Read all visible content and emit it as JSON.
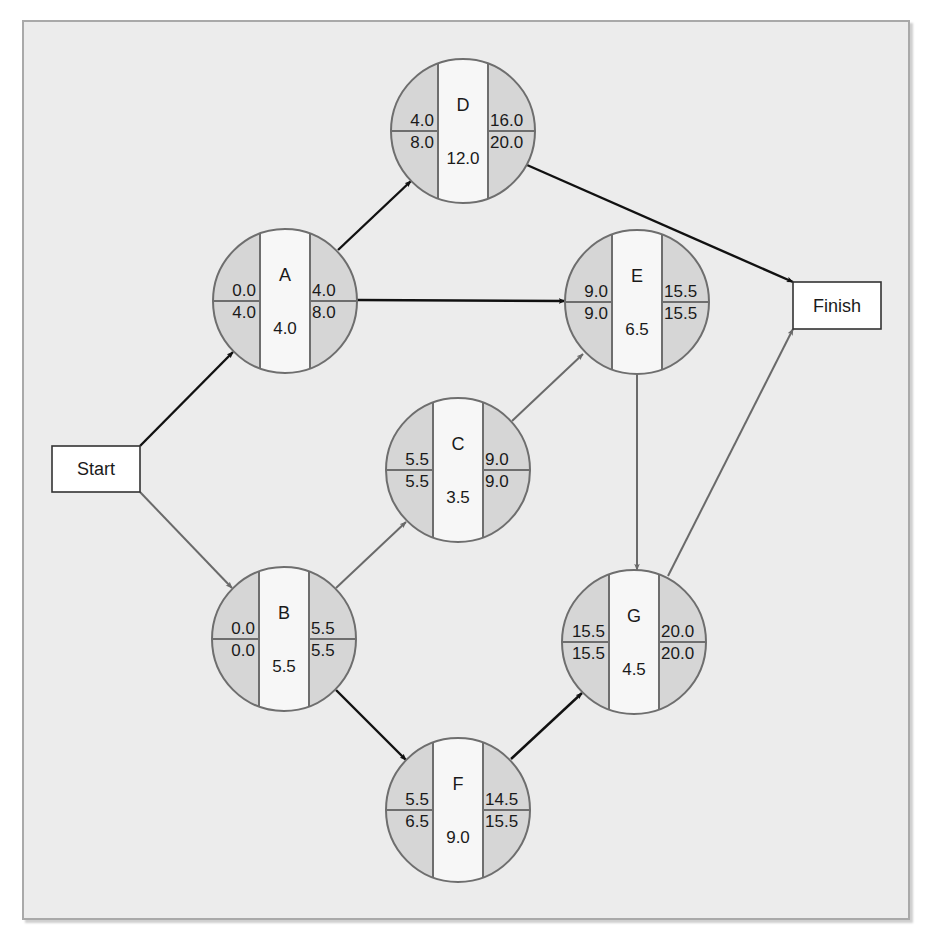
{
  "diagram": {
    "type": "activity-on-node network (project schedule / critical path)",
    "colors": {
      "panel_bg": "#ececec",
      "panel_border": "#a9a9a9",
      "node_side_fill": "#d6d6d6",
      "node_center_fill": "#f7f7f7",
      "node_outline": "#6e6e6e",
      "critical_arrow": "#111111",
      "noncritical_arrow": "#6a6a6a",
      "terminal_fill": "#ffffff",
      "terminal_border": "#333333"
    },
    "terminals": [
      {
        "id": "start",
        "label": "Start",
        "x": 52,
        "y": 446,
        "w": 88,
        "h": 46
      },
      {
        "id": "finish",
        "label": "Finish",
        "x": 793,
        "y": 282,
        "w": 88,
        "h": 47
      }
    ],
    "activities": [
      {
        "id": "A",
        "label": "A",
        "cx": 285,
        "cy": 301,
        "r": 72,
        "es": "0.0",
        "ls": "4.0",
        "ef": "4.0",
        "lf": "8.0",
        "duration": "4.0"
      },
      {
        "id": "B",
        "label": "B",
        "cx": 284,
        "cy": 639,
        "r": 72,
        "es": "0.0",
        "ls": "0.0",
        "ef": "5.5",
        "lf": "5.5",
        "duration": "5.5"
      },
      {
        "id": "C",
        "label": "C",
        "cx": 458,
        "cy": 470,
        "r": 72,
        "es": "5.5",
        "ls": "5.5",
        "ef": "9.0",
        "lf": "9.0",
        "duration": "3.5"
      },
      {
        "id": "D",
        "label": "D",
        "cx": 463,
        "cy": 131,
        "r": 72,
        "es": "4.0",
        "ls": "8.0",
        "ef": "16.0",
        "lf": "20.0",
        "duration": "12.0"
      },
      {
        "id": "E",
        "label": "E",
        "cx": 637,
        "cy": 302,
        "r": 72,
        "es": "9.0",
        "ls": "9.0",
        "ef": "15.5",
        "lf": "15.5",
        "duration": "6.5"
      },
      {
        "id": "F",
        "label": "F",
        "cx": 458,
        "cy": 810,
        "r": 72,
        "es": "5.5",
        "ls": "6.5",
        "ef": "14.5",
        "lf": "15.5",
        "duration": "9.0"
      },
      {
        "id": "G",
        "label": "G",
        "cx": 634,
        "cy": 642,
        "r": 72,
        "es": "15.5",
        "ls": "15.5",
        "ef": "20.0",
        "lf": "20.0",
        "duration": "4.5"
      }
    ],
    "edges": [
      {
        "from": "start",
        "to": "A",
        "style": "black",
        "x1": 140,
        "y1": 446,
        "x2": 233,
        "y2": 352
      },
      {
        "from": "start",
        "to": "B",
        "style": "gray",
        "x1": 140,
        "y1": 492,
        "x2": 232,
        "y2": 588
      },
      {
        "from": "A",
        "to": "D",
        "style": "black",
        "x1": 338,
        "y1": 250,
        "x2": 411,
        "y2": 181
      },
      {
        "from": "A",
        "to": "E",
        "style": "black",
        "x1": 357,
        "y1": 300,
        "x2": 565,
        "y2": 301
      },
      {
        "from": "B",
        "to": "C",
        "style": "gray",
        "x1": 336,
        "y1": 588,
        "x2": 406,
        "y2": 522
      },
      {
        "from": "B",
        "to": "F",
        "style": "black",
        "x1": 336,
        "y1": 690,
        "x2": 406,
        "y2": 760
      },
      {
        "from": "C",
        "to": "E",
        "style": "gray",
        "x1": 512,
        "y1": 421,
        "x2": 583,
        "y2": 354
      },
      {
        "from": "E",
        "to": "G",
        "style": "gray",
        "x1": 637,
        "y1": 374,
        "x2": 637,
        "y2": 570
      },
      {
        "from": "F",
        "to": "G",
        "style": "black",
        "x1": 511,
        "y1": 759,
        "x2": 582,
        "y2": 693
      },
      {
        "from": "D",
        "to": "Finish",
        "style": "black",
        "x1": 527,
        "y1": 165,
        "x2": 793,
        "y2": 282
      },
      {
        "from": "G",
        "to": "Finish",
        "style": "gray",
        "x1": 668,
        "y1": 576,
        "x2": 793,
        "y2": 329
      }
    ]
  }
}
